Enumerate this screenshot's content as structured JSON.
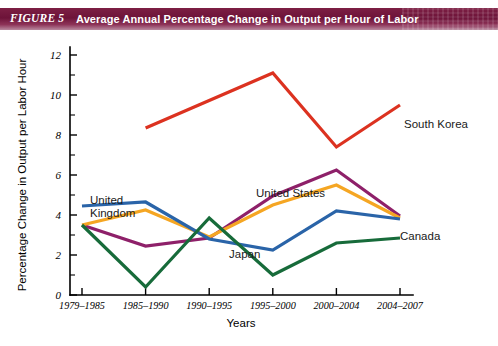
{
  "figure": {
    "tag": "FIGURE 5",
    "title": "Average Annual Percentage Change in Output per Hour of Labor"
  },
  "chart_data": {
    "type": "line",
    "title": "Average Annual Percentage Change in Output per Hour of Labor",
    "xlabel": "Years",
    "ylabel": "Percentage Change in Output per Labor Hour",
    "categories": [
      "1979–1985",
      "1985–1990",
      "1990–1995",
      "1995–2000",
      "2000–2004",
      "2004–2007"
    ],
    "ylim": [
      0,
      12
    ],
    "ytick_labels": [
      "0",
      "2",
      "4",
      "6",
      "8",
      "10",
      "12"
    ],
    "ytick_values": [
      0,
      2,
      4,
      6,
      8,
      10,
      12
    ],
    "minor_tick_step": 1,
    "grid": false,
    "legend_position": "inline-annotations",
    "series": [
      {
        "name": "South Korea",
        "color": "#DC3220",
        "values": [
          null,
          8.35,
          null,
          11.1,
          7.4,
          9.5
        ],
        "label_x_frac": 1.03,
        "label_y_value": 9.9
      },
      {
        "name": "United States",
        "color": "#8E2069",
        "values": [
          3.5,
          2.45,
          2.85,
          4.95,
          6.25,
          3.95
        ],
        "label_x_frac": 0.62,
        "label_y_value": 6.25
      },
      {
        "name": "Japan",
        "color": "#F5A623",
        "values": [
          3.5,
          4.25,
          2.9,
          4.5,
          5.5,
          3.85
        ],
        "label_x_frac": 0.58,
        "label_y_value": 2.9
      },
      {
        "name": "United Kingdom",
        "color": "#2A64A8",
        "values": [
          4.45,
          4.65,
          2.8,
          2.25,
          4.2,
          3.8
        ],
        "label_x_frac": 0.16,
        "label_y_value": 5.6
      },
      {
        "name": "Canada",
        "color": "#176B3A",
        "values": [
          3.5,
          0.4,
          3.85,
          1.0,
          2.6,
          2.85
        ],
        "label_x_frac": 1.03,
        "label_y_value": 2.85
      }
    ]
  }
}
